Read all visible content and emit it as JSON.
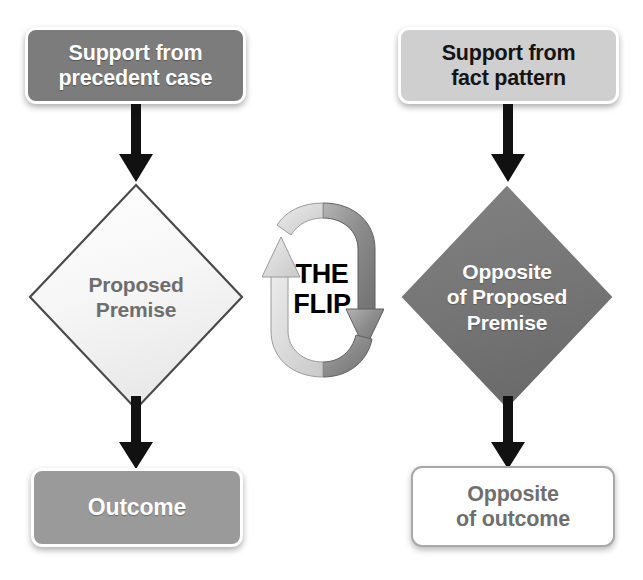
{
  "diagram": {
    "title": "The Flip",
    "colors": {
      "dark_gray": "#7c7c7c",
      "light_gray": "#cfcfcf",
      "medium_gray": "#9a9a9a",
      "diamond_dark": "#757575",
      "diamond_light": "#f2f2f2",
      "arrow_black": "#111111",
      "flip_light": "#d2d2d2",
      "flip_dark": "#808080",
      "white": "#ffffff",
      "text_gray": "#6e6e6e"
    },
    "left_branch": {
      "support_box": "Support from\nprecedent case",
      "premise_diamond": "Proposed\nPremise",
      "outcome_box": "Outcome"
    },
    "right_branch": {
      "support_box": "Support from\nfact pattern",
      "premise_diamond": "Opposite\nof Proposed\nPremise",
      "outcome_box": "Opposite\nof outcome"
    },
    "center": {
      "flip_line1": "THE",
      "flip_line2": "FLIP"
    }
  }
}
